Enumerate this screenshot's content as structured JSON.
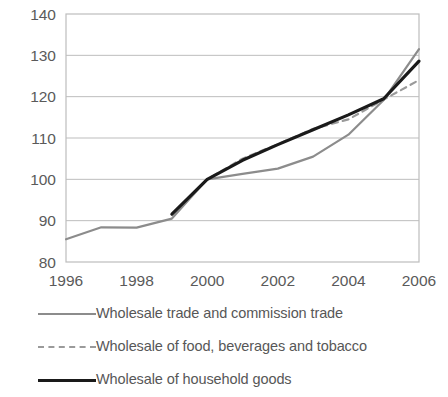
{
  "chart_data": {
    "type": "line",
    "title": "",
    "subtitle": "",
    "xlabel": "",
    "ylabel": "",
    "xlim": [
      1996,
      2006
    ],
    "ylim": [
      80,
      140
    ],
    "yticks": [
      80,
      90,
      100,
      110,
      120,
      130,
      140
    ],
    "xticks": [
      1996,
      1998,
      2000,
      2002,
      2004,
      2006
    ],
    "xtick_labels": [
      "1996",
      "1998",
      "2000",
      "2002",
      "2004",
      "2006"
    ],
    "ytick_labels": [
      "80",
      "90",
      "100",
      "110",
      "120",
      "130",
      "140"
    ],
    "grid": "horizontal",
    "legend_position": "bottom-left",
    "x": [
      1996,
      1997,
      1998,
      1999,
      2000,
      2001,
      2002,
      2003,
      2004,
      2005,
      2006
    ],
    "series": [
      {
        "name": "Wholesale trade and commission trade",
        "style": "solid",
        "color": "#8c8c8c",
        "width": 2.2,
        "x": [
          1996,
          1997,
          1998,
          1999,
          2000,
          2001,
          2002,
          2003,
          2004,
          2005,
          2006
        ],
        "values": [
          85.5,
          88.4,
          88.3,
          90.5,
          100.0,
          101.3,
          102.6,
          105.5,
          110.8,
          119.2,
          131.5
        ]
      },
      {
        "name": "Wholesale of food, beverages and tobacco",
        "style": "dashed",
        "color": "#9a9a9a",
        "width": 2.2,
        "x": [
          1999,
          2000,
          2001,
          2002,
          2003,
          2004,
          2005,
          2006
        ],
        "values": [
          91.5,
          100.0,
          105.0,
          108.5,
          112.2,
          114.5,
          119.3,
          124.0
        ]
      },
      {
        "name": "Wholesale of household goods",
        "style": "solid",
        "color": "#1a1a1a",
        "width": 3.2,
        "x": [
          1999,
          2000,
          2001,
          2002,
          2003,
          2004,
          2005,
          2006
        ],
        "values": [
          91.6,
          100.0,
          104.6,
          108.4,
          112.0,
          115.6,
          119.5,
          128.6
        ]
      }
    ]
  },
  "legend": {
    "items": [
      {
        "label": "Wholesale trade and commission trade",
        "swatch": "solid-gray"
      },
      {
        "label": "Wholesale of food, beverages and tobacco",
        "swatch": "dashed-gray"
      },
      {
        "label": "Wholesale of household goods",
        "swatch": "solid-black"
      }
    ]
  },
  "axes": {
    "frame_color": "#bdbdbd",
    "grid_color": "#bdbdbd"
  }
}
